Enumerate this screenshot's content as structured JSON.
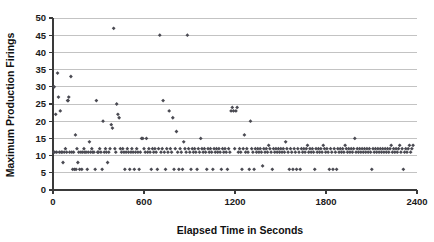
{
  "chart_data": {
    "type": "scatter",
    "title": "",
    "xlabel": "Elapsed Time in Seconds",
    "ylabel": "Maximum Production Firings",
    "xlim": [
      0,
      2400
    ],
    "ylim": [
      0,
      50
    ],
    "xticks": [
      0,
      600,
      1200,
      1800,
      2400
    ],
    "yticks": [
      0,
      5,
      10,
      15,
      20,
      25,
      30,
      35,
      40,
      45,
      50
    ],
    "grid": "horizontal",
    "legend": "none",
    "marker": "diamond",
    "marker_color": "#4a4a52",
    "series": [
      {
        "name": "Maximum Production Firings",
        "points": [
          [
            5,
            11
          ],
          [
            8,
            30
          ],
          [
            12,
            11
          ],
          [
            18,
            22
          ],
          [
            24,
            11
          ],
          [
            30,
            34
          ],
          [
            36,
            27
          ],
          [
            42,
            11
          ],
          [
            48,
            23
          ],
          [
            54,
            11
          ],
          [
            60,
            11
          ],
          [
            66,
            8
          ],
          [
            74,
            11
          ],
          [
            82,
            12
          ],
          [
            90,
            11
          ],
          [
            96,
            26
          ],
          [
            100,
            26
          ],
          [
            104,
            27
          ],
          [
            110,
            11
          ],
          [
            118,
            33
          ],
          [
            124,
            11
          ],
          [
            130,
            6
          ],
          [
            136,
            11
          ],
          [
            142,
            6
          ],
          [
            148,
            16
          ],
          [
            152,
            6
          ],
          [
            158,
            12
          ],
          [
            164,
            8
          ],
          [
            170,
            11
          ],
          [
            176,
            6
          ],
          [
            184,
            11
          ],
          [
            190,
            6
          ],
          [
            196,
            11
          ],
          [
            204,
            12
          ],
          [
            210,
            11
          ],
          [
            218,
            11
          ],
          [
            226,
            6
          ],
          [
            232,
            11
          ],
          [
            240,
            14
          ],
          [
            248,
            11
          ],
          [
            256,
            12
          ],
          [
            262,
            11
          ],
          [
            270,
            11
          ],
          [
            278,
            6
          ],
          [
            286,
            26
          ],
          [
            294,
            11
          ],
          [
            300,
            11
          ],
          [
            308,
            12
          ],
          [
            316,
            11
          ],
          [
            324,
            6
          ],
          [
            330,
            20
          ],
          [
            338,
            11
          ],
          [
            346,
            12
          ],
          [
            352,
            11
          ],
          [
            360,
            8
          ],
          [
            368,
            11
          ],
          [
            376,
            12
          ],
          [
            384,
            19
          ],
          [
            392,
            18
          ],
          [
            400,
            47
          ],
          [
            408,
            12
          ],
          [
            414,
            11
          ],
          [
            420,
            25
          ],
          [
            428,
            22
          ],
          [
            436,
            21
          ],
          [
            444,
            12
          ],
          [
            452,
            11
          ],
          [
            460,
            12
          ],
          [
            468,
            11
          ],
          [
            474,
            6
          ],
          [
            482,
            11
          ],
          [
            490,
            12
          ],
          [
            498,
            11
          ],
          [
            506,
            6
          ],
          [
            514,
            11
          ],
          [
            520,
            12
          ],
          [
            528,
            11
          ],
          [
            536,
            6
          ],
          [
            544,
            11
          ],
          [
            552,
            12
          ],
          [
            560,
            11
          ],
          [
            568,
            6
          ],
          [
            576,
            11
          ],
          [
            584,
            15
          ],
          [
            592,
            15
          ],
          [
            600,
            12
          ],
          [
            608,
            11
          ],
          [
            616,
            15
          ],
          [
            624,
            11
          ],
          [
            632,
            12
          ],
          [
            640,
            11
          ],
          [
            648,
            6
          ],
          [
            656,
            12
          ],
          [
            664,
            11
          ],
          [
            672,
            12
          ],
          [
            680,
            11
          ],
          [
            688,
            6
          ],
          [
            696,
            12
          ],
          [
            704,
            45
          ],
          [
            712,
            11
          ],
          [
            720,
            12
          ],
          [
            726,
            26
          ],
          [
            734,
            11
          ],
          [
            742,
            6
          ],
          [
            750,
            12
          ],
          [
            758,
            11
          ],
          [
            766,
            23
          ],
          [
            774,
            12
          ],
          [
            782,
            11
          ],
          [
            790,
            21
          ],
          [
            798,
            6
          ],
          [
            806,
            12
          ],
          [
            814,
            17
          ],
          [
            822,
            11
          ],
          [
            830,
            6
          ],
          [
            838,
            12
          ],
          [
            846,
            11
          ],
          [
            854,
            6
          ],
          [
            862,
            14
          ],
          [
            870,
            12
          ],
          [
            878,
            11
          ],
          [
            886,
            45
          ],
          [
            894,
            12
          ],
          [
            902,
            11
          ],
          [
            910,
            6
          ],
          [
            918,
            12
          ],
          [
            926,
            11
          ],
          [
            934,
            12
          ],
          [
            942,
            11
          ],
          [
            950,
            6
          ],
          [
            958,
            12
          ],
          [
            966,
            11
          ],
          [
            974,
            15
          ],
          [
            982,
            12
          ],
          [
            990,
            11
          ],
          [
            998,
            12
          ],
          [
            1006,
            11
          ],
          [
            1014,
            6
          ],
          [
            1022,
            12
          ],
          [
            1030,
            11
          ],
          [
            1038,
            12
          ],
          [
            1046,
            11
          ],
          [
            1054,
            6
          ],
          [
            1062,
            12
          ],
          [
            1070,
            11
          ],
          [
            1078,
            12
          ],
          [
            1086,
            11
          ],
          [
            1094,
            12
          ],
          [
            1102,
            11
          ],
          [
            1110,
            6
          ],
          [
            1118,
            12
          ],
          [
            1126,
            11
          ],
          [
            1134,
            12
          ],
          [
            1142,
            11
          ],
          [
            1150,
            6
          ],
          [
            1158,
            12
          ],
          [
            1166,
            11
          ],
          [
            1174,
            23
          ],
          [
            1182,
            24
          ],
          [
            1190,
            23
          ],
          [
            1198,
            12
          ],
          [
            1206,
            23
          ],
          [
            1214,
            24
          ],
          [
            1222,
            11
          ],
          [
            1230,
            12
          ],
          [
            1238,
            11
          ],
          [
            1246,
            6
          ],
          [
            1254,
            12
          ],
          [
            1262,
            16
          ],
          [
            1270,
            11
          ],
          [
            1278,
            12
          ],
          [
            1286,
            11
          ],
          [
            1294,
            6
          ],
          [
            1302,
            20
          ],
          [
            1310,
            12
          ],
          [
            1318,
            11
          ],
          [
            1326,
            6
          ],
          [
            1334,
            12
          ],
          [
            1342,
            11
          ],
          [
            1350,
            12
          ],
          [
            1358,
            11
          ],
          [
            1366,
            12
          ],
          [
            1374,
            11
          ],
          [
            1382,
            7
          ],
          [
            1390,
            12
          ],
          [
            1398,
            11
          ],
          [
            1406,
            12
          ],
          [
            1414,
            11
          ],
          [
            1422,
            13
          ],
          [
            1430,
            12
          ],
          [
            1438,
            11
          ],
          [
            1446,
            6
          ],
          [
            1454,
            12
          ],
          [
            1462,
            11
          ],
          [
            1470,
            12
          ],
          [
            1478,
            11
          ],
          [
            1486,
            12
          ],
          [
            1494,
            11
          ],
          [
            1502,
            12
          ],
          [
            1510,
            11
          ],
          [
            1518,
            12
          ],
          [
            1526,
            11
          ],
          [
            1534,
            14
          ],
          [
            1542,
            12
          ],
          [
            1550,
            11
          ],
          [
            1558,
            6
          ],
          [
            1566,
            12
          ],
          [
            1574,
            11
          ],
          [
            1582,
            6
          ],
          [
            1590,
            12
          ],
          [
            1598,
            11
          ],
          [
            1606,
            6
          ],
          [
            1614,
            12
          ],
          [
            1622,
            11
          ],
          [
            1630,
            6
          ],
          [
            1638,
            12
          ],
          [
            1646,
            11
          ],
          [
            1654,
            12
          ],
          [
            1662,
            11
          ],
          [
            1670,
            12
          ],
          [
            1678,
            13
          ],
          [
            1686,
            11
          ],
          [
            1694,
            12
          ],
          [
            1702,
            11
          ],
          [
            1710,
            12
          ],
          [
            1718,
            11
          ],
          [
            1726,
            6
          ],
          [
            1734,
            12
          ],
          [
            1742,
            11
          ],
          [
            1750,
            12
          ],
          [
            1758,
            11
          ],
          [
            1766,
            12
          ],
          [
            1774,
            11
          ],
          [
            1782,
            13
          ],
          [
            1790,
            12
          ],
          [
            1798,
            11
          ],
          [
            1806,
            12
          ],
          [
            1814,
            11
          ],
          [
            1822,
            6
          ],
          [
            1830,
            12
          ],
          [
            1838,
            11
          ],
          [
            1846,
            6
          ],
          [
            1854,
            12
          ],
          [
            1862,
            11
          ],
          [
            1870,
            6
          ],
          [
            1878,
            12
          ],
          [
            1886,
            11
          ],
          [
            1894,
            12
          ],
          [
            1902,
            11
          ],
          [
            1910,
            12
          ],
          [
            1918,
            11
          ],
          [
            1926,
            13
          ],
          [
            1934,
            12
          ],
          [
            1942,
            11
          ],
          [
            1950,
            12
          ],
          [
            1958,
            11
          ],
          [
            1966,
            12
          ],
          [
            1974,
            11
          ],
          [
            1982,
            12
          ],
          [
            1990,
            15
          ],
          [
            1998,
            11
          ],
          [
            2006,
            12
          ],
          [
            2014,
            11
          ],
          [
            2022,
            12
          ],
          [
            2030,
            11
          ],
          [
            2038,
            12
          ],
          [
            2046,
            11
          ],
          [
            2054,
            12
          ],
          [
            2062,
            11
          ],
          [
            2070,
            12
          ],
          [
            2078,
            11
          ],
          [
            2086,
            12
          ],
          [
            2094,
            11
          ],
          [
            2102,
            6
          ],
          [
            2110,
            12
          ],
          [
            2118,
            11
          ],
          [
            2126,
            12
          ],
          [
            2134,
            11
          ],
          [
            2142,
            12
          ],
          [
            2150,
            11
          ],
          [
            2158,
            12
          ],
          [
            2166,
            11
          ],
          [
            2174,
            12
          ],
          [
            2182,
            11
          ],
          [
            2190,
            12
          ],
          [
            2198,
            11
          ],
          [
            2206,
            12
          ],
          [
            2214,
            11
          ],
          [
            2222,
            12
          ],
          [
            2230,
            13
          ],
          [
            2238,
            11
          ],
          [
            2246,
            12
          ],
          [
            2254,
            11
          ],
          [
            2262,
            12
          ],
          [
            2270,
            11
          ],
          [
            2278,
            12
          ],
          [
            2286,
            13
          ],
          [
            2294,
            11
          ],
          [
            2302,
            12
          ],
          [
            2310,
            6
          ],
          [
            2318,
            11
          ],
          [
            2326,
            12
          ],
          [
            2334,
            11
          ],
          [
            2342,
            12
          ],
          [
            2350,
            13
          ],
          [
            2358,
            11
          ],
          [
            2366,
            12
          ],
          [
            2374,
            13
          ]
        ]
      }
    ]
  }
}
